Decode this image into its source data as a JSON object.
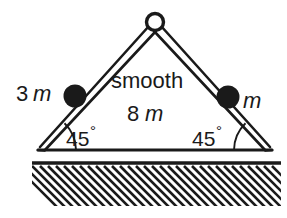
{
  "figure": {
    "background_color": "#ffffff",
    "stroke_color": "#1a1a1a",
    "width": 287,
    "height": 218
  },
  "labels": {
    "left_mass_number": "3",
    "left_mass_unit": "m",
    "right_mass_unit": "m",
    "surface_text": "smooth",
    "base_length_number": "8",
    "base_length_unit": "m",
    "left_angle_value": "45",
    "left_angle_degree": "°",
    "right_angle_value": "45",
    "right_angle_degree": "°"
  },
  "geometry": {
    "apex_x": 155,
    "apex_y": 22,
    "apex_pivot_radius": 8.5,
    "left_base_x": 38,
    "left_base_y": 150,
    "right_base_x": 272,
    "right_base_y": 150,
    "left_mass_x": 75,
    "left_mass_y": 96,
    "left_mass_radius": 11,
    "right_mass_x": 228,
    "right_mass_y": 97,
    "right_mass_radius": 11,
    "ground_line_y": 163,
    "ground_left_x": 32,
    "ground_right_x": 281,
    "ground_bottom_y": 205
  },
  "icons": {
    "pivot": "hollow-circle-pivot",
    "mass": "filled-circle-mass",
    "ground": "diagonal-hatching"
  }
}
